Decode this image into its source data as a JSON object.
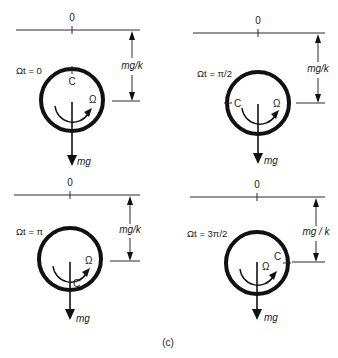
{
  "figure": {
    "caption": "(c)",
    "panels": [
      {
        "phase_label": "Ωt = 0",
        "origin_label": "0",
        "center_label": "C",
        "spin_label": "Ω",
        "force_label": "mg",
        "dimension_label": "mg/k"
      },
      {
        "phase_label": "Ωt = π/2",
        "origin_label": "0",
        "center_label": "C",
        "spin_label": "Ω",
        "force_label": "mg",
        "dimension_label": "mg/k"
      },
      {
        "phase_label": "Ωt = π",
        "origin_label": "0",
        "center_label": "C",
        "spin_label": "Ω",
        "force_label": "mg",
        "dimension_label": "mg/k"
      },
      {
        "phase_label": "Ωt = 3π/2",
        "origin_label": "0",
        "center_label": "C",
        "spin_label": "Ω",
        "force_label": "mg",
        "dimension_label": "mg / k"
      }
    ]
  }
}
